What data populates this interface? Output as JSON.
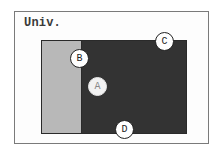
{
  "diagram": {
    "universe_label": "Univ.",
    "regions": [
      {
        "id": "light-region",
        "shade": "light",
        "color": "#b8b8b8"
      },
      {
        "id": "dark-region",
        "shade": "dark",
        "color": "#333333"
      }
    ],
    "points": [
      {
        "label": "A",
        "x": 97,
        "y": 86
      },
      {
        "label": "B",
        "x": 79,
        "y": 58
      },
      {
        "label": "C",
        "x": 164,
        "y": 41
      },
      {
        "label": "D",
        "x": 124,
        "y": 129
      }
    ]
  }
}
